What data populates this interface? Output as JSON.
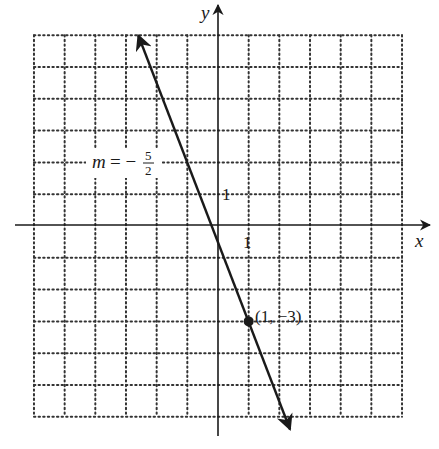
{
  "chart_data": {
    "type": "line",
    "title": "",
    "xlabel": "x",
    "ylabel": "y",
    "xlim": [
      -6,
      6
    ],
    "ylim": [
      -6,
      6
    ],
    "grid": true,
    "grid_style": "dotted",
    "tick_labels": {
      "x": [
        "1"
      ],
      "y": [
        "1"
      ]
    },
    "series": [
      {
        "name": "line",
        "equation": "y = -5/2 x - 1/2",
        "slope": -2.5,
        "intercept": -0.5,
        "x": [
          -2.6,
          2.35
        ],
        "y": [
          6.0,
          -6.4
        ],
        "arrows": "both"
      }
    ],
    "points": [
      {
        "x": 1,
        "y": -3,
        "label": "(1, −3)"
      }
    ],
    "annotations": [
      {
        "text": "m = − 5/2",
        "slope_num": "5",
        "slope_den": "2"
      }
    ]
  },
  "labels": {
    "x_axis": "x",
    "y_axis": "y",
    "x_tick_1": "1",
    "y_tick_1": "1",
    "point": "(1, −3)",
    "slope_m": "m",
    "slope_eq": "= −",
    "slope_num": "5",
    "slope_den": "2"
  },
  "colors": {
    "ink": "#1a1a1a",
    "grid": "#333333",
    "background": "#ffffff"
  }
}
